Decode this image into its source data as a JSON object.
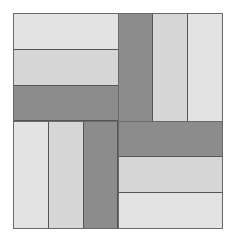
{
  "figure": {
    "title": "",
    "type": "rail-fence quilt block",
    "colors": {
      "light1": "#e3e3e3",
      "light2": "#d6d6d6",
      "dark": "#8c8c8c",
      "outline": "#6a6a6a"
    },
    "quadrants": [
      {
        "position": "top-left",
        "orientation": "horizontal",
        "strips": [
          "light1",
          "light2",
          "dark"
        ]
      },
      {
        "position": "top-right",
        "orientation": "vertical",
        "strips": [
          "dark",
          "light2",
          "light1"
        ]
      },
      {
        "position": "bottom-left",
        "orientation": "vertical",
        "strips": [
          "light1",
          "light2",
          "dark"
        ]
      },
      {
        "position": "bottom-right",
        "orientation": "horizontal",
        "strips": [
          "dark",
          "light2",
          "light1"
        ]
      }
    ]
  }
}
